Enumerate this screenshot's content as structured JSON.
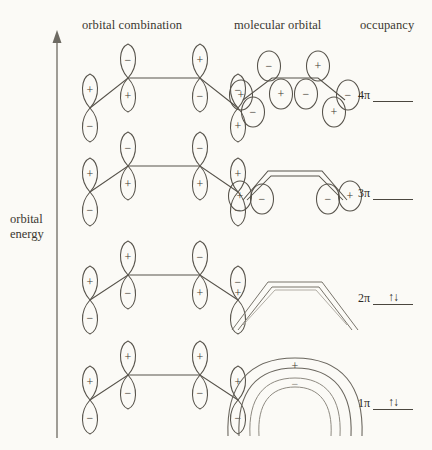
{
  "headers": {
    "orbital_combination": "orbital combination",
    "molecular_orbital": "molecular orbital",
    "occupancy": "occupancy"
  },
  "axis": {
    "line1": "orbital",
    "line2": "energy",
    "direction": "up",
    "meaning": "increasing orbital energy"
  },
  "levels": [
    {
      "name": "4π",
      "electrons": "",
      "electron_count": 0,
      "nodes": 3,
      "top_lobe_signs": [
        "−",
        "−",
        "+",
        "−"
      ],
      "bottom_lobe_signs": [
        "+",
        "+",
        "−",
        "+"
      ],
      "mo_style": "four-separated-lobes"
    },
    {
      "name": "3π",
      "electrons": "",
      "electron_count": 0,
      "nodes": 2,
      "top_lobe_signs": [
        "+",
        "−",
        "−",
        "+"
      ],
      "bottom_lobe_signs": [
        "−",
        "+",
        "+",
        "−"
      ],
      "mo_style": "band-with-end-lobes"
    },
    {
      "name": "2π",
      "electrons": "↑↓",
      "electron_count": 2,
      "nodes": 1,
      "top_lobe_signs": [
        "+",
        "+",
        "−",
        "−"
      ],
      "bottom_lobe_signs": [
        "−",
        "−",
        "+",
        "+"
      ],
      "mo_style": "two-thin-bands"
    },
    {
      "name": "1π",
      "electrons": "↑↓",
      "electron_count": 2,
      "nodes": 0,
      "top_lobe_signs": [
        "+",
        "+",
        "+",
        "+"
      ],
      "bottom_lobe_signs": [
        "−",
        "−",
        "−",
        "−"
      ],
      "mo_style": "full-arch",
      "mo_top_sign": "+",
      "mo_bottom_sign": "−"
    }
  ],
  "colors": {
    "background": "#fbfaf6",
    "ink": "#4a463e",
    "text": "#2d2a25"
  }
}
